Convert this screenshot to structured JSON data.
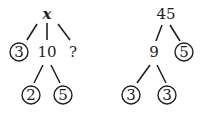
{
  "trees": [
    {
      "name": "left-factor-tree",
      "root": "x",
      "level1": [
        "3",
        "10",
        "?"
      ],
      "level2": [
        "2",
        "5"
      ],
      "circled": [
        "3",
        "2",
        "5"
      ]
    },
    {
      "name": "right-factor-tree",
      "root": "45",
      "level1": [
        "9",
        "5"
      ],
      "level2": [
        "3",
        "3"
      ],
      "circled": [
        "5",
        "3",
        "3"
      ]
    }
  ],
  "colors": {
    "ink": "#231f20",
    "background": "#ffffff"
  }
}
